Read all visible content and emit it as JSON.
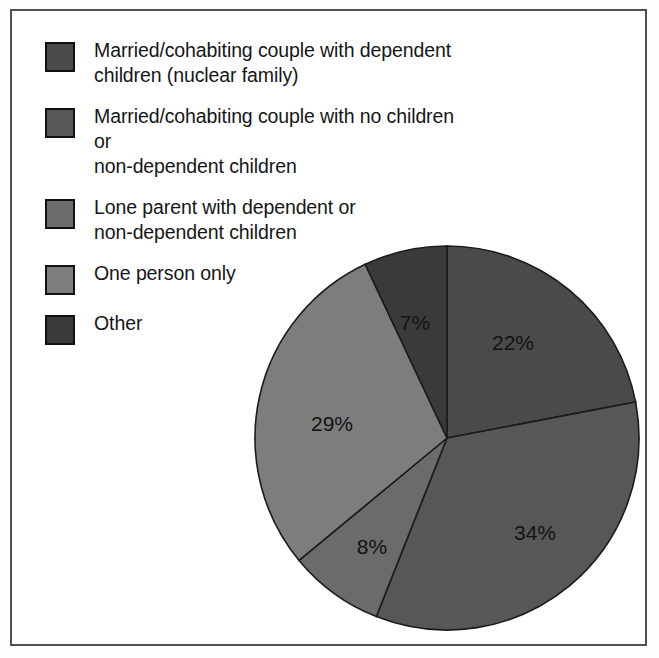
{
  "figure": {
    "background_color": "#ffffff",
    "frame_color": "#4d5055"
  },
  "legend": {
    "items": [
      {
        "label": "Married/cohabiting couple with dependent\nchildren (nuclear family)",
        "color": "#4a4a4a",
        "swatch_name": "legend-swatch-nuclear-family"
      },
      {
        "label": "Married/cohabiting couple with no children or\nnon-dependent children",
        "color": "#575757",
        "swatch_name": "legend-swatch-couple-no-children"
      },
      {
        "label": "Lone parent with dependent or\nnon-dependent children",
        "color": "#6b6b6b",
        "swatch_name": "legend-swatch-lone-parent"
      },
      {
        "label": "One person only",
        "color": "#7d7d7d",
        "swatch_name": "legend-swatch-one-person-only"
      },
      {
        "label": "Other",
        "color": "#3a3a3a",
        "swatch_name": "legend-swatch-other"
      }
    ]
  },
  "chart_data": {
    "type": "pie",
    "title": "",
    "xlabel": "",
    "ylabel": "",
    "legend_position": "left",
    "start_angle_deg": 0,
    "direction": "clockwise",
    "categories": [
      "Married/cohabiting couple with dependent children (nuclear family)",
      "Married/cohabiting couple with no children or non-dependent children",
      "Lone parent with dependent or non-dependent children",
      "One person only",
      "Other"
    ],
    "values": [
      22,
      34,
      8,
      29,
      7
    ],
    "labels": [
      "22%",
      "34%",
      "8%",
      "29%",
      "7%"
    ],
    "colors": [
      "#4a4a4a",
      "#575757",
      "#6b6b6b",
      "#7d7d7d",
      "#3a3a3a"
    ],
    "units": "percent",
    "total": 100,
    "slices": [
      {
        "name": "nuclear-family",
        "label": "22%",
        "value": 22,
        "color": "#4a4a4a",
        "label_x": 261,
        "label_y": 101
      },
      {
        "name": "couple-no-children",
        "label": "34%",
        "value": 34,
        "color": "#575757",
        "label_x": 283,
        "label_y": 291
      },
      {
        "name": "lone-parent",
        "label": "8%",
        "value": 8,
        "color": "#6b6b6b",
        "label_x": 120,
        "label_y": 305
      },
      {
        "name": "one-person-only",
        "label": "29%",
        "value": 29,
        "color": "#7d7d7d",
        "label_x": 80,
        "label_y": 182
      },
      {
        "name": "other",
        "label": "7%",
        "value": 7,
        "color": "#3a3a3a",
        "label_x": 163,
        "label_y": 81
      }
    ]
  }
}
